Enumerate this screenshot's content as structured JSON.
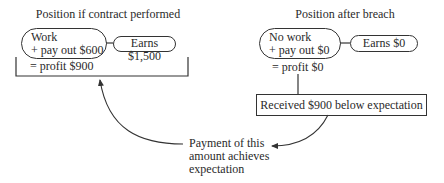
{
  "left": {
    "title": "Position if contract performed",
    "action_line1": "Work",
    "action_line2": "+ pay out $600",
    "earns": "Earns $1,500",
    "result": "= profit $900"
  },
  "right": {
    "title": "Position after breach",
    "action_line1": "No work",
    "action_line2": "+ pay out $0",
    "earns": "Earns $0",
    "result": "= profit $0",
    "shortfall": "Received $900 below expectation"
  },
  "note": {
    "line1": "Payment of this",
    "line2": "amount achieves",
    "line3": "expectation"
  },
  "colors": {
    "line": "#333333",
    "text": "#2a2a2a",
    "background": "#ffffff"
  }
}
